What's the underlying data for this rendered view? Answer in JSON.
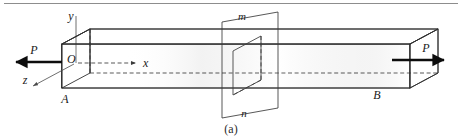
{
  "figure": {
    "caption": "(a)",
    "top_rule": {
      "visible": true,
      "x1": 4,
      "x2": 458,
      "y": 3,
      "color": "#8d8d8d"
    }
  },
  "labels": {
    "origin": "O",
    "axis_x": "x",
    "axis_y": "y",
    "axis_z": "z",
    "force_left": "P",
    "force_right": "P",
    "end_left": "A",
    "end_right": "B",
    "section_top": "m",
    "section_bottom": "n"
  },
  "colors": {
    "bar_front_light": "#e2e2e2",
    "bar_front_mid": "#c9c9c9",
    "bar_front_dark": "#b0b0b0",
    "bar_top_light": "#c2c2c2",
    "bar_top_dark": "#a8a8a8",
    "bar_end_light": "#d4d4d4",
    "bar_end_dark": "#aeaeae",
    "plane_fill": "#d8d8d8",
    "section_fill": "#c4c4c4",
    "edge_stroke": "#2f2f2f",
    "hidden_stroke": "#3a3a3a",
    "arrow_black": "#0d0d0d",
    "page_background": "#ffffff"
  },
  "geometry": {
    "bar": {
      "front_top_left": [
        62,
        44
      ],
      "front_top_right": [
        410,
        44
      ],
      "front_bottom_left": [
        62,
        88
      ],
      "front_bottom_right": [
        410,
        88
      ],
      "depth_dx": 28,
      "depth_dy": -15
    },
    "cutting_plane": {
      "top_left": [
        222,
        22
      ],
      "top_right": [
        278,
        12
      ],
      "bottom_left": [
        222,
        118
      ],
      "bottom_right": [
        278,
        108
      ]
    },
    "section_face": {
      "top_left": [
        233,
        51
      ],
      "top_right": [
        261,
        36
      ],
      "bottom_left": [
        233,
        95
      ],
      "bottom_right": [
        261,
        80
      ]
    },
    "axes": {
      "y_from": [
        76,
        16
      ],
      "y_to": [
        76,
        62
      ],
      "x_from": [
        78,
        63
      ],
      "x_to": [
        140,
        63
      ],
      "z_from": [
        74,
        65
      ],
      "z_to": [
        30,
        88
      ]
    },
    "forces": {
      "left_arrow_from": [
        62,
        62
      ],
      "left_arrow_to": [
        12,
        62
      ],
      "right_arrow_from": [
        392,
        60
      ],
      "right_arrow_to": [
        448,
        60
      ]
    }
  }
}
